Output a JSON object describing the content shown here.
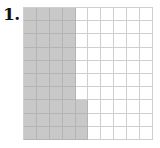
{
  "problem": {
    "number_label": "1."
  },
  "grid": {
    "rows": 10,
    "cols": 10,
    "shaded_color": "#c8c8c8",
    "line_color": "#cfcfcf",
    "shaded_cells_count": 43,
    "shaded_description": "Columns 1-4 fully shaded (40 cells) plus column 5 bottom 3 rows (3 cells)",
    "shaded_full_columns": [
      0,
      1,
      2,
      3
    ],
    "shaded_partial": {
      "col": 4,
      "rows": [
        7,
        8,
        9
      ]
    }
  }
}
